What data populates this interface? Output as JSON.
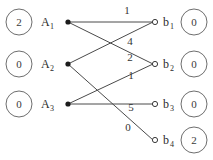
{
  "diagram": {
    "type": "bipartite-flow-graph",
    "left_nodes": [
      {
        "id": "A1",
        "label": "A",
        "subscript": "1",
        "capacity": "2",
        "x": 68,
        "y": 22
      },
      {
        "id": "A2",
        "label": "A",
        "subscript": "2",
        "capacity": "0",
        "x": 68,
        "y": 64
      },
      {
        "id": "A3",
        "label": "A",
        "subscript": "3",
        "capacity": "0",
        "x": 68,
        "y": 104
      }
    ],
    "right_nodes": [
      {
        "id": "b1",
        "label": "b",
        "subscript": "1",
        "capacity": "0",
        "x": 156,
        "y": 22
      },
      {
        "id": "b2",
        "label": "b",
        "subscript": "2",
        "capacity": "0",
        "x": 156,
        "y": 64
      },
      {
        "id": "b3",
        "label": "b",
        "subscript": "3",
        "capacity": "0",
        "x": 156,
        "y": 104
      },
      {
        "id": "b4",
        "label": "b",
        "subscript": "4",
        "capacity": "2",
        "x": 156,
        "y": 140
      }
    ],
    "edges": [
      {
        "from": "A1",
        "to": "b1",
        "weight": "1",
        "label_x": 127,
        "label_y": 14
      },
      {
        "from": "A1",
        "to": "b2",
        "weight": "4",
        "label_x": 130,
        "label_y": 45
      },
      {
        "from": "A2",
        "to": "b1",
        "weight": "2",
        "label_x": 130,
        "label_y": 61
      },
      {
        "from": "A3",
        "to": "b2",
        "weight": "1",
        "label_x": 131,
        "label_y": 79
      },
      {
        "from": "A3",
        "to": "b3",
        "weight": "5",
        "label_x": 131,
        "label_y": 111
      },
      {
        "from": "A2",
        "to": "b4",
        "weight": "0",
        "label_x": 128,
        "label_y": 131
      }
    ],
    "left_capacity_circles": [
      {
        "value": "2",
        "cx": 19,
        "cy": 22,
        "r": 13
      },
      {
        "value": "0",
        "cx": 19,
        "cy": 64,
        "r": 13
      },
      {
        "value": "0",
        "cx": 19,
        "cy": 104,
        "r": 13
      }
    ],
    "right_capacity_circles": [
      {
        "value": "0",
        "cx": 194,
        "cy": 22,
        "r": 13
      },
      {
        "value": "0",
        "cx": 194,
        "cy": 64,
        "r": 13
      },
      {
        "value": "0",
        "cx": 194,
        "cy": 104,
        "r": 13
      },
      {
        "value": "2",
        "cx": 194,
        "cy": 140,
        "r": 13
      }
    ],
    "colors": {
      "edge": "#4a4a4a",
      "circle_stroke": "#6e6e6e",
      "source_dot": "#1c1c1c",
      "background": "#ffffff"
    }
  }
}
